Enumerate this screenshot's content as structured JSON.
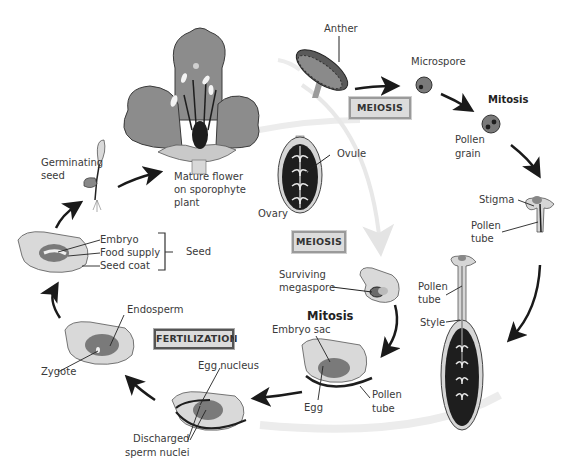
{
  "stages": {
    "mature_flower": {
      "label": "Mature flower\non sporophyte\nplant",
      "line1": "Mature flower",
      "line2": "on sporophyte",
      "line3": "plant"
    },
    "anther": {
      "label": "Anther"
    },
    "microspore": {
      "label": "Microspore"
    },
    "mitosis_pollen": {
      "label": "Mitosis"
    },
    "pollen_grain": {
      "line1": "Pollen",
      "line2": "grain"
    },
    "stigma": {
      "label": "Stigma"
    },
    "pollen_tube_1": {
      "line1": "Pollen",
      "line2": "tube"
    },
    "pollen_tube_2": {
      "line1": "Pollen",
      "line2": "tube"
    },
    "style": {
      "label": "Style"
    },
    "ovule": {
      "label": "Ovule"
    },
    "ovary": {
      "label": "Ovary"
    },
    "surviving_megaspore": {
      "line1": "Surviving",
      "line2": "megaspore"
    },
    "mitosis_embryo": {
      "label": "Mitosis"
    },
    "embryo_sac": {
      "label": "Embryo sac"
    },
    "egg": {
      "label": "Egg"
    },
    "pollen_tube_3": {
      "line1": "Pollen",
      "line2": "tube"
    },
    "egg_nucleus": {
      "label": "Egg nucleus"
    },
    "discharged_sperm": {
      "line1": "Discharged",
      "line2": "sperm nuclei"
    },
    "endosperm": {
      "label": "Endosperm"
    },
    "zygote": {
      "label": "Zygote"
    },
    "embryo": {
      "label": "Embryo"
    },
    "food_supply": {
      "label": "Food supply"
    },
    "seed_coat": {
      "label": "Seed coat"
    },
    "seed": {
      "label": "Seed"
    },
    "germinating_seed": {
      "line1": "Germinating",
      "line2": "seed"
    }
  },
  "process_boxes": {
    "meiosis_male": "MEIOSIS",
    "meiosis_female": "MEIOSIS",
    "fertilization": "FERTILIZATION"
  },
  "colors": {
    "petal": "#8c8c8c",
    "dark_fill": "#1e1e1e",
    "light_fill": "#d4d4d4",
    "mid_fill": "#7a7a7a",
    "arrow": "#1a1a1a",
    "faint_arrow": "#e6e6e6",
    "box_fill": "#dcdcdc"
  }
}
